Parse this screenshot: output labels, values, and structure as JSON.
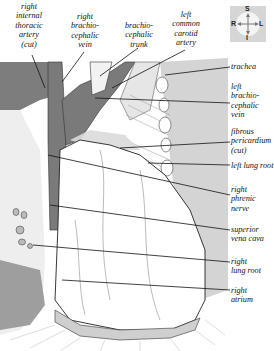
{
  "diagram": {
    "top_labels": [
      {
        "id": "right-internal-thoracic-artery",
        "lines": [
          "right",
          "internal",
          "thoracic",
          "artery",
          "(cut)"
        ]
      },
      {
        "id": "right-brachiocephalic-vein",
        "lines": [
          "right",
          "brachio-",
          "cephalic",
          "vein"
        ]
      },
      {
        "id": "brachiocephalic-trunk",
        "lines": [
          "brachio-",
          "cephalic",
          "trunk"
        ]
      },
      {
        "id": "left-common-carotid-artery",
        "lines": [
          "left",
          "common",
          "carotid",
          "artery"
        ]
      }
    ],
    "right_labels": [
      {
        "id": "trachea",
        "lines": [
          "trachea"
        ]
      },
      {
        "id": "left-brachiocephalic-vein",
        "lines": [
          "left",
          "brachio-",
          "cephalic",
          "vein"
        ]
      },
      {
        "id": "fibrous-pericardium",
        "lines": [
          "fibrous",
          "pericardium",
          "(cut)"
        ]
      },
      {
        "id": "left-lung-root",
        "lines": [
          "left lung root"
        ]
      },
      {
        "id": "right-phrenic-nerve",
        "lines": [
          "right",
          "phrenic",
          "nerve"
        ]
      },
      {
        "id": "superior-vena-cava",
        "lines": [
          "superior",
          "vena cava"
        ]
      },
      {
        "id": "right-lung-root",
        "lines": [
          "right",
          "lung root"
        ]
      },
      {
        "id": "right-atrium",
        "lines": [
          "right",
          "atrium"
        ]
      }
    ],
    "compass": {
      "top": "S",
      "bottom": "I",
      "left": "R",
      "right": "L"
    },
    "colors": {
      "vessel_dark": "#7a7a7a",
      "background_grey": "#d4d4d4",
      "line": "#111111",
      "heart_fill": "#ffffff"
    }
  }
}
